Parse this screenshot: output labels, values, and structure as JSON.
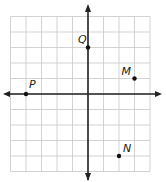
{
  "diagram": {
    "type": "coordinate-grid",
    "grid": {
      "x_min": -5,
      "x_max": 4,
      "y_min": -5,
      "y_max": 5,
      "cell_px": 15.5,
      "origin_px": [
        88,
        94
      ]
    },
    "colors": {
      "grid": "#c8c8c8",
      "axis": "#222222",
      "point": "#111111",
      "label": "#222222",
      "background": "#ffffff"
    },
    "points": [
      {
        "label": "P",
        "x": -4,
        "y": 0
      },
      {
        "label": "Q",
        "x": 0,
        "y": 3
      },
      {
        "label": "M",
        "x": 3,
        "y": 1
      },
      {
        "label": "N",
        "x": 2,
        "y": -4
      }
    ]
  }
}
